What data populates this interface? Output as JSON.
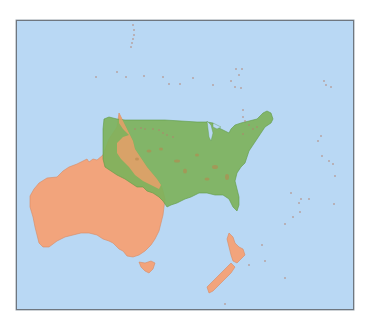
{
  "map": {
    "title": "",
    "ocean_color": "#b9d8f4",
    "frame_border_color": "#6f7780",
    "layers": [
      {
        "id": "australia",
        "label": "Australia",
        "fill": "#f2a47c",
        "stroke": "#d88a63",
        "opacity": 1.0,
        "path": "M13,175 L17,168 L22,162 L30,157 L40,156 L46,150 L52,146 L60,143 L66,140 L70,138 L72,141 L76,138 L80,139 L86,134 L89,126 L92,118 L96,112 L100,106 L102,92 L105,98 L108,104 L112,112 L116,120 L118,128 L122,134 L126,140 L130,146 L135,152 L140,158 L144,164 L146,170 L148,178 L147,186 L146,194 L144,202 L142,210 L138,218 L134,224 L128,230 L122,234 L116,236 L110,235 L106,230 L102,228 L100,226 L96,222 L92,220 L86,218 L80,214 L72,212 L64,212 L56,214 L48,216 L40,220 L32,226 L26,226 L22,222 L20,214 L18,206 L16,196 L13,186 Z"
      },
      {
        "id": "tasmania",
        "label": "Tasmania",
        "fill": "#f2a47c",
        "stroke": "#d88a63",
        "path": "M122,241 L128,242 L134,240 L138,242 L136,248 L132,252 L128,250 L124,246 Z"
      },
      {
        "id": "nz-north",
        "label": "New Zealand North Island",
        "fill": "#f2a47c",
        "stroke": "#d88a63",
        "path": "M212,212 L216,216 L218,222 L222,226 L226,228 L228,234 L224,238 L220,242 L216,240 L214,234 L212,226 L210,218 Z"
      },
      {
        "id": "nz-south",
        "label": "New Zealand South Island",
        "fill": "#f2a47c",
        "stroke": "#d88a63",
        "path": "M214,242 L218,246 L214,252 L208,258 L202,264 L196,270 L192,272 L190,266 L194,262 L200,256 L206,250 Z"
      },
      {
        "id": "usa",
        "label": "United States",
        "fill": "#7db25b",
        "stroke": "#5f9a45",
        "opacity": 0.92,
        "path": "M87,98 L92,96 L100,98 L108,99 L118,99 L132,99 L148,99 L164,100 L180,101 L190,101 L196,102 L200,106 L204,108 L208,110 L212,112 L214,108 L218,104 L224,102 L232,100 L240,98 L246,92 L250,90 L254,92 L256,98 L254,102 L248,106 L244,112 L240,118 L236,124 L232,130 L230,136 L228,142 L224,146 L220,152 L218,160 L220,168 L222,176 L222,184 L220,190 L216,186 L212,178 L206,174 L198,174 L190,172 L182,172 L174,176 L168,178 L160,182 L154,184 L150,186 L146,180 L142,176 L136,172 L130,170 L126,166 L120,166 L114,162 L108,158 L100,154 L94,150 L88,146 L86,138 L86,128 L86,118 L86,108 Z"
      },
      {
        "id": "overlap-cape-york",
        "label": "Australia Cape York overlap",
        "fill": "#e8a06a",
        "stroke": "none",
        "opacity": 0.85,
        "path": "M102,92 L105,98 L108,104 L112,112 L116,120 L118,128 L122,134 L126,140 L130,146 L135,152 L140,158 L144,164 L142,168 L134,164 L126,160 L118,154 L112,146 L104,138 L100,132 L100,122 L106,116 L112,114 L106,108 L102,102 Z"
      }
    ],
    "great_lakes": [
      "M190,100 L194,104 L196,112 L194,120 L192,116 L191,108 Z",
      "M196,102 L204,106 L200,108 L196,106 Z"
    ],
    "island_color": "#b37f6c",
    "islands": [
      [
        116,
        4
      ],
      [
        117,
        9
      ],
      [
        117,
        14
      ],
      [
        116,
        18
      ],
      [
        115,
        22
      ],
      [
        114,
        26
      ],
      [
        100,
        51
      ],
      [
        79,
        56
      ],
      [
        109,
        56
      ],
      [
        127,
        55
      ],
      [
        146,
        56
      ],
      [
        152,
        63
      ],
      [
        176,
        57
      ],
      [
        163,
        63
      ],
      [
        196,
        64
      ],
      [
        214,
        60
      ],
      [
        222,
        54
      ],
      [
        219,
        48
      ],
      [
        225,
        48
      ],
      [
        218,
        66
      ],
      [
        224,
        67
      ],
      [
        226,
        89
      ],
      [
        226,
        96
      ],
      [
        228,
        100
      ],
      [
        232,
        104
      ],
      [
        236,
        108
      ],
      [
        240,
        106
      ],
      [
        226,
        113
      ],
      [
        307,
        60
      ],
      [
        309,
        64
      ],
      [
        314,
        66
      ],
      [
        304,
        115
      ],
      [
        301,
        120
      ],
      [
        305,
        135
      ],
      [
        312,
        140
      ],
      [
        316,
        143
      ],
      [
        318,
        155
      ],
      [
        274,
        172
      ],
      [
        284,
        178
      ],
      [
        292,
        178
      ],
      [
        282,
        182
      ],
      [
        283,
        191
      ],
      [
        276,
        196
      ],
      [
        268,
        203
      ],
      [
        317,
        183
      ],
      [
        245,
        224
      ],
      [
        248,
        240
      ],
      [
        232,
        244
      ],
      [
        208,
        283
      ],
      [
        268,
        257
      ],
      [
        118,
        108
      ],
      [
        124,
        107
      ],
      [
        128,
        108
      ],
      [
        136,
        108
      ],
      [
        142,
        109
      ],
      [
        146,
        112
      ],
      [
        150,
        114
      ],
      [
        156,
        116
      ]
    ],
    "usa_internal_marks": [
      [
        160,
        140,
        6,
        3
      ],
      [
        168,
        150,
        4,
        5
      ],
      [
        198,
        146,
        6,
        4
      ],
      [
        210,
        156,
        4,
        6
      ],
      [
        190,
        158,
        5,
        3
      ],
      [
        120,
        138,
        4,
        3
      ],
      [
        132,
        130,
        5,
        3
      ],
      [
        144,
        128,
        4,
        3
      ],
      [
        180,
        134,
        4,
        3
      ]
    ]
  }
}
